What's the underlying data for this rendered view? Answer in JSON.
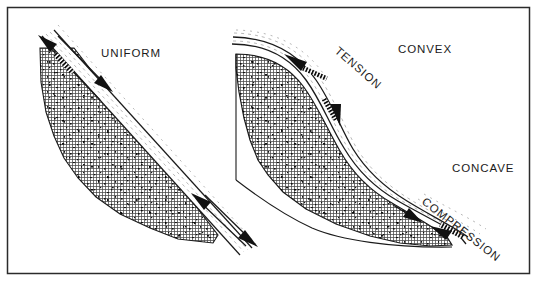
{
  "figure": {
    "kind": "geological-cross-section-diagram",
    "background_color": "#ffffff",
    "ink_color": "#1b1b1b",
    "border": {
      "present": true,
      "color": "#2b2b2b",
      "width_px": 1.4
    }
  },
  "panels": [
    {
      "id": "left-panel",
      "name": "uniform-slip-surface-panel",
      "label": "UNIFORM",
      "label_rotation_deg": 0,
      "surface_shape": "planar",
      "arrows": [
        {
          "name": "upslope-arrow-uniform",
          "direction": "up-left",
          "style": "solid-head-hatched-tail"
        },
        {
          "name": "downslope-arrow-uniform-upper",
          "direction": "down-right",
          "style": "solid-head"
        },
        {
          "name": "upslope-arrow-uniform-lower",
          "direction": "up-left",
          "style": "solid-head"
        },
        {
          "name": "downslope-arrow-uniform-lower",
          "direction": "down-right",
          "style": "solid-head"
        }
      ]
    },
    {
      "id": "right-panel",
      "name": "curved-slip-surface-panel",
      "surface_shape": "sigmoidal",
      "labels": [
        {
          "text": "TENSION",
          "rotation_deg": 41,
          "zone": "convex-upper"
        },
        {
          "text": "CONVEX",
          "rotation_deg": 0,
          "zone": "upper"
        },
        {
          "text": "CONCAVE",
          "rotation_deg": 0,
          "zone": "lower"
        },
        {
          "text": "COMPRESSION",
          "rotation_deg": 38,
          "zone": "concave-lower"
        }
      ],
      "arrows": [
        {
          "name": "tension-arrow-upslope",
          "direction": "up-left",
          "style": "solid-head-hatched-tail"
        },
        {
          "name": "tension-arrow-downslope",
          "direction": "down-right",
          "style": "solid-head-hatched-tail"
        },
        {
          "name": "compression-arrow-downslope",
          "direction": "down-right",
          "style": "solid-head"
        },
        {
          "name": "compression-arrow-upslope",
          "direction": "up-left",
          "style": "solid-head-hatched-tail"
        }
      ]
    }
  ],
  "labels": {
    "uniform": "UNIFORM",
    "tension": "TENSION",
    "convex": "CONVEX",
    "concave": "CONCAVE",
    "compression": "COMPRESSION"
  },
  "textures": {
    "rock_mass": {
      "name": "cross-hatch-stipple",
      "hatch_color": "#3a3a3a",
      "speckle_color": "#111111",
      "spacing_px": 3
    },
    "shear_band": {
      "name": "fine-dashed-striation",
      "color": "#8a8a8a"
    }
  }
}
